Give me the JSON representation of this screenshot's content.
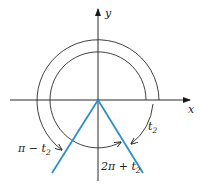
{
  "diagram": {
    "axes": {
      "x_label": "x",
      "y_label": "y"
    },
    "angle_labels": {
      "t2": "t",
      "t2_sub": "2",
      "pi_minus_t2_prefix": "π − t",
      "pi_minus_t2_sub": "2",
      "two_pi_plus_t2_prefix": "2π + t",
      "two_pi_plus_t2_sub": "2"
    },
    "colors": {
      "ray": "#2f8fc8",
      "ink": "#2a2a2a"
    }
  }
}
